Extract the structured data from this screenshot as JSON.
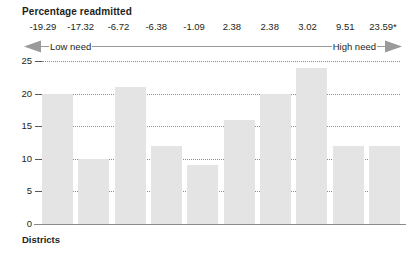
{
  "chart_data": {
    "type": "bar",
    "title": "Percentage readmitted",
    "xlabel": "Districts",
    "ylabel": "",
    "ylim": [
      0,
      25
    ],
    "yticks": [
      25,
      20,
      15,
      10,
      5,
      0
    ],
    "grid": true,
    "legend": null,
    "categories": [
      "-19.29",
      "-17.32",
      "-6.72",
      "-6.38",
      "-1.09",
      "2.38",
      "2.38",
      "3.02",
      "9.51",
      "23.59*"
    ],
    "values": [
      20,
      10,
      21,
      12,
      9,
      16,
      20,
      24,
      12,
      12
    ],
    "annotations": {
      "top_axis_values": [
        "-19.29",
        "-17.32",
        "-6.72",
        "-6.38",
        "-1.09",
        "2.38",
        "2.38",
        "3.02",
        "9.51",
        "23.59*"
      ],
      "scale_left_label": "Low need",
      "scale_right_label": "High need",
      "scale_direction": "double-headed arrow from low need (left) to high need (right)"
    },
    "colors": {
      "bar_fill": "#e4e4e4",
      "gridline": "#8c8c8c",
      "axis": "#8a8a8a",
      "text": "#231f20",
      "arrow": "#9a9a9a"
    }
  }
}
